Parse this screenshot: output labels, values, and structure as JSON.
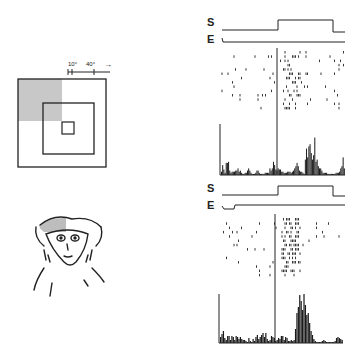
{
  "figure": {
    "scale_bar": {
      "small_label": "10°",
      "large_label": "40°",
      "arrow": "→"
    },
    "stimulus_diagram": {
      "outer_square": "40° field",
      "middle_square": "receptive field",
      "inner_square": "fixation",
      "shaded_quadrant": "upper-left",
      "shade_color": "#c8c8c8"
    },
    "monkey": {
      "description": "line drawing of monkey face",
      "shaded_region": "upper-left head",
      "shade_color": "#bdbdbd"
    },
    "panels": [
      {
        "id": "top",
        "trace_labels": {
          "stimulus": "S",
          "eye": "E"
        },
        "stimulus_on_x": 278,
        "stimulus_off_x": 333,
        "raster_rows": 14,
        "histogram": [
          3,
          9,
          5,
          2,
          11,
          11,
          12,
          4,
          2,
          3,
          3,
          3,
          4,
          4,
          6,
          3,
          4,
          2,
          1,
          1,
          2,
          2,
          4,
          6,
          4,
          2,
          1,
          1,
          1,
          2,
          4,
          4,
          2,
          1,
          1,
          1,
          1,
          2,
          2,
          2,
          2,
          6,
          4,
          6,
          12,
          9,
          5,
          4,
          6,
          5,
          5,
          3,
          3,
          2,
          2,
          2,
          3,
          3,
          3,
          2,
          3,
          4,
          6,
          8,
          11,
          8,
          4,
          3,
          3,
          2,
          1,
          14,
          24,
          16,
          26,
          28,
          20,
          14,
          18,
          34,
          12,
          14,
          8,
          6,
          6,
          4,
          2,
          2,
          2,
          2,
          1,
          1,
          1,
          1,
          1,
          1,
          1,
          2,
          2,
          2,
          3,
          6,
          8,
          16,
          6
        ]
      },
      {
        "id": "bottom",
        "trace_labels": {
          "stimulus": "S",
          "eye": "E"
        },
        "stimulus_on_x": 278,
        "stimulus_off_x": 333,
        "raster_rows": 14,
        "histogram": [
          6,
          9,
          12,
          5,
          3,
          7,
          7,
          3,
          7,
          6,
          3,
          7,
          6,
          4,
          6,
          4,
          3,
          3,
          2,
          1,
          5,
          2,
          1,
          4,
          2,
          6,
          8,
          4,
          6,
          8,
          10,
          6,
          10,
          4,
          2,
          3,
          7,
          6,
          5,
          2,
          3,
          5,
          4,
          7,
          7,
          3,
          6,
          5,
          2,
          2,
          3,
          2,
          3,
          14,
          30,
          36,
          48,
          42,
          33,
          49,
          38,
          28,
          30,
          20,
          12,
          8,
          4,
          2,
          1,
          1,
          1,
          1,
          2,
          3,
          2,
          1,
          1,
          1,
          1,
          1,
          1,
          2,
          5,
          6,
          5,
          4,
          3
        ]
      }
    ]
  }
}
